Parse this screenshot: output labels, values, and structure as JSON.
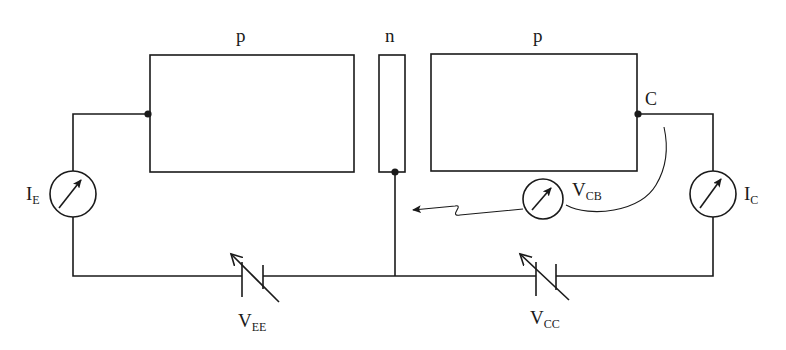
{
  "diagram": {
    "title": "",
    "colors": {
      "ink": "#1a1a1a",
      "background": "#ffffff"
    },
    "regions": [
      {
        "id": "emitter",
        "label": "p"
      },
      {
        "id": "base",
        "label": "n"
      },
      {
        "id": "collector",
        "label": "p"
      }
    ],
    "terminals": {
      "collector": {
        "label": "C"
      }
    },
    "meters": [
      {
        "id": "ie",
        "main": "I",
        "sub": "E",
        "type": "ammeter"
      },
      {
        "id": "vcb",
        "main": "V",
        "sub": "CB",
        "type": "voltmeter"
      },
      {
        "id": "ic",
        "main": "I",
        "sub": "C",
        "type": "ammeter"
      }
    ],
    "sources": [
      {
        "id": "vee",
        "main": "V",
        "sub": "EE",
        "type": "variable-battery"
      },
      {
        "id": "vcc",
        "main": "V",
        "sub": "CC",
        "type": "variable-battery"
      }
    ]
  }
}
